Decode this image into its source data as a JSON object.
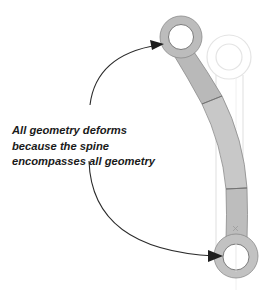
{
  "callout": {
    "lines": [
      "All geometry deforms",
      "because the spine",
      "encompasses all geometry"
    ]
  },
  "colors": {
    "part_fill": "#bdbdbd",
    "part_fill_light": "#c9c9c9",
    "part_edge": "#8a8a8a",
    "ghost_outline": "#e6e6e6",
    "arrow": "#2b2b2b",
    "text": "#1a1a1a",
    "background": "#ffffff"
  },
  "figure": {
    "part": "bent-link",
    "ghost_part": "original-straight-link",
    "arrow_targets": [
      "top-eyelet",
      "bottom-eyelet"
    ]
  }
}
